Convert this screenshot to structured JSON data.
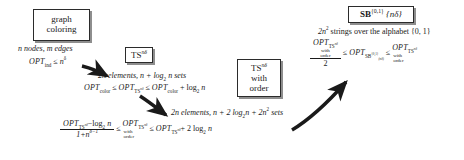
{
  "diagram": {
    "nodes": [
      {
        "id": "graph-coloring",
        "lines": [
          "graph",
          "coloring"
        ]
      },
      {
        "id": "ts-nd-left",
        "lines": [
          "TS"
        ],
        "superscript": "nδ"
      },
      {
        "id": "ts-nd-order",
        "lines": [
          "TS",
          "with",
          "order"
        ],
        "superscript": "nδ"
      },
      {
        "id": "sb-01",
        "lines": [
          "SB"
        ],
        "superscript": "{0,1}",
        "braced": "{nδ}"
      }
    ],
    "annotations": {
      "graph_coloring_params": "n nodes, m edges",
      "graph_coloring_bound_opt": "OPT",
      "graph_coloring_bound_sub": "ind",
      "graph_coloring_bound_rel": "≤",
      "graph_coloring_bound_rhs": "n",
      "graph_coloring_bound_rhs_sup": "δ",
      "ts_left_params": "2n elements, n + log",
      "ts_left_params_sub": "2",
      "ts_left_params_tail": "n sets",
      "ts_left_ineq_a_opt": "OPT",
      "ts_left_ineq_a_sub": "color",
      "ts_left_ineq_rel1": "≤",
      "ts_left_ineq_b_opt": "OPT",
      "ts_left_ineq_b_sub": "TS",
      "ts_left_ineq_b_sup": "nδ",
      "ts_left_ineq_rel2": "≤",
      "ts_left_ineq_c_opt": "OPT",
      "ts_left_ineq_c_sub": "color",
      "ts_left_ineq_c_tail": "+ log",
      "ts_left_ineq_c_tail_sub": "2",
      "ts_left_ineq_c_tail_end": "n",
      "ts_order_params_head": "2n elements, n + 2 log",
      "ts_order_params_sub": "2",
      "ts_order_params_mid": "n + 2n",
      "ts_order_params_sup": "2",
      "ts_order_params_tail": "sets",
      "ts_order_frac_num_opt": "OPT",
      "ts_order_frac_num_sub": "TS",
      "ts_order_frac_num_sup": "nδ",
      "ts_order_frac_num_tail": "−log",
      "ts_order_frac_num_tail_sub": "2",
      "ts_order_frac_num_tail_end": "n",
      "ts_order_frac_den": "1+n",
      "ts_order_frac_den_sup": "δ−1",
      "ts_order_rel1": "≤",
      "ts_order_mid_opt": "OPT",
      "ts_order_mid_sub": "TS",
      "ts_order_mid_sup": "nδ",
      "ts_order_mid_with": "with",
      "ts_order_mid_order": "order",
      "ts_order_rel2": "≤",
      "ts_order_right_opt": "OPT",
      "ts_order_right_sub": "TS",
      "ts_order_right_sup": "nδ",
      "ts_order_right_tail": "+ 2 log",
      "ts_order_right_tail_sub": "2",
      "ts_order_right_tail_end": "n",
      "sb_params_head": "2n",
      "sb_params_sup": "2",
      "sb_params_tail": "strings over the alphabet {0, 1}",
      "sb_frac_num_opt": "OPT",
      "sb_frac_num_sub": "TS",
      "sb_frac_num_sup": "nδ",
      "sb_frac_num_with": "with",
      "sb_frac_num_order": "order",
      "sb_frac_den": "2",
      "sb_rel1": "≤",
      "sb_mid_opt": "OPT",
      "sb_mid_sub": "SB",
      "sb_mid_sup": "{0,1}",
      "sb_mid_sub2": "(nδ)",
      "sb_rel2": "≤",
      "sb_right_opt": "OPT",
      "sb_right_sub": "TS",
      "sb_right_sup": "nδ",
      "sb_right_with": "with",
      "sb_right_order": "order"
    },
    "colors": {
      "ink": "#1a1a1a",
      "box_border": "#2b2b2b",
      "box_shadow": "#8e8e8e",
      "background": "#ffffff"
    }
  }
}
